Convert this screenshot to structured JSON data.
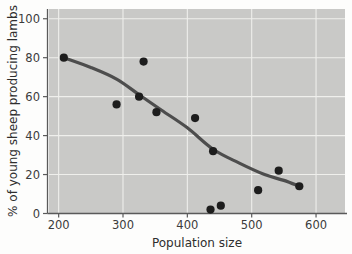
{
  "chart_data": {
    "type": "scatter",
    "title": "",
    "xlabel": "Population size",
    "ylabel": "% of young sheep producing lambs",
    "xlim": [
      185,
      645
    ],
    "ylim": [
      0,
      105
    ],
    "xticks": [
      200,
      300,
      400,
      500,
      600
    ],
    "yticks": [
      0,
      20,
      40,
      60,
      80,
      100
    ],
    "xtick_labels": [
      "200",
      "300",
      "400",
      "500",
      "600"
    ],
    "ytick_labels": [
      "0",
      "20",
      "40",
      "60",
      "80",
      "100"
    ],
    "grid": true,
    "legend": "none",
    "point_color": "#1d1d1d",
    "curve_color": "#4d4d4d",
    "plot_background": "#c9c9c7",
    "points": [
      {
        "x": 208,
        "y": 80
      },
      {
        "x": 290,
        "y": 56
      },
      {
        "x": 325,
        "y": 60
      },
      {
        "x": 332,
        "y": 78
      },
      {
        "x": 352,
        "y": 52
      },
      {
        "x": 412,
        "y": 49
      },
      {
        "x": 440,
        "y": 32
      },
      {
        "x": 436,
        "y": 2
      },
      {
        "x": 452,
        "y": 4
      },
      {
        "x": 510,
        "y": 12
      },
      {
        "x": 542,
        "y": 22
      },
      {
        "x": 574,
        "y": 14
      }
    ],
    "trend_curve": [
      {
        "x": 208,
        "y": 80
      },
      {
        "x": 250,
        "y": 75
      },
      {
        "x": 290,
        "y": 69
      },
      {
        "x": 325,
        "y": 61
      },
      {
        "x": 360,
        "y": 53
      },
      {
        "x": 400,
        "y": 44
      },
      {
        "x": 440,
        "y": 33
      },
      {
        "x": 480,
        "y": 26
      },
      {
        "x": 520,
        "y": 20
      },
      {
        "x": 550,
        "y": 17
      },
      {
        "x": 574,
        "y": 14
      }
    ],
    "series_name": "Sheep reproduction vs population size",
    "point_count": 12
  },
  "figure": {
    "axis_color": "#5a5a5a",
    "grid_color": "#efefec",
    "page_background": "#fdfdfc"
  }
}
